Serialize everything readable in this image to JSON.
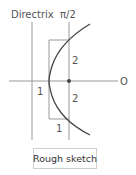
{
  "diagram": {
    "labels": {
      "directrix": "Directrix",
      "pi_over_2": "π/2",
      "origin": "O",
      "dist_left": "1",
      "upper_height": "2",
      "lower_height": "2",
      "bottom_width": "1"
    },
    "colors": {
      "curve": "#444444",
      "axes": "#999999",
      "text": "#555555"
    }
  },
  "button": {
    "label": "Rough sketch"
  }
}
